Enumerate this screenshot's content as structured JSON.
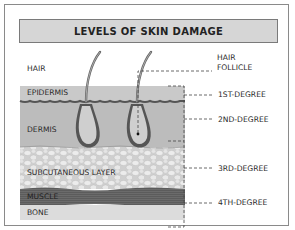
{
  "title": "LEVELS OF SKIN DAMAGE",
  "layers": [
    {
      "name": "HAIR"
    },
    {
      "name": "EPIDERMIS"
    },
    {
      "name": "DERMIS"
    },
    {
      "name": "SUBCUTANEOUS LAYER"
    },
    {
      "name": "MUSCLE"
    },
    {
      "name": "BONE"
    }
  ],
  "annotations": {
    "hair_follicle": [
      "HAIR",
      "FOLLICLE"
    ],
    "degrees": [
      "1ST-DEGREE",
      "2ND-DEGREE",
      "3RD-DEGREE",
      "4TH-DEGREE"
    ]
  },
  "colors": {
    "epidermis": "#c8c8c8",
    "dermis": "#bdbdbd",
    "subcutaneous": "#d2d2d2",
    "muscle": "#5a5a5a",
    "bone": "#dcdcdc",
    "title_bg": "#d6d6d6"
  }
}
